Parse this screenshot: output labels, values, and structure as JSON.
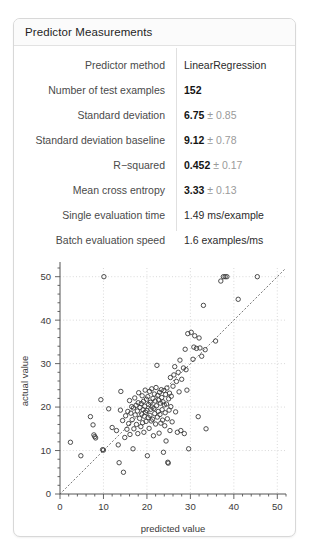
{
  "card": {
    "title": "Predictor Measurements"
  },
  "metrics": {
    "rows": [
      {
        "label": "Predictor method",
        "value_main": "LinearRegression",
        "value_pm": "",
        "bold": false
      },
      {
        "label": "Number of test examples",
        "value_main": "152",
        "value_pm": "",
        "bold": true
      },
      {
        "label": "Standard deviation",
        "value_main": "6.75",
        "value_pm": "± 0.85",
        "bold": true
      },
      {
        "label": "Standard deviation baseline",
        "value_main": "9.12",
        "value_pm": "± 0.78",
        "bold": true
      },
      {
        "label": "R−squared",
        "value_main": "0.452",
        "value_pm": "± 0.17",
        "bold": true
      },
      {
        "label": "Mean cross entropy",
        "value_main": "3.33",
        "value_pm": "± 0.13",
        "bold": true
      },
      {
        "label": "Single evaluation time",
        "value_main": "1.49 ms/example",
        "value_pm": "",
        "bold": false
      },
      {
        "label": "Batch evaluation speed",
        "value_main": "1.6 examples/ms",
        "value_pm": "",
        "bold": false
      }
    ]
  },
  "chart_data": {
    "type": "scatter",
    "title": "",
    "xlabel": "predicted value",
    "ylabel": "actual value",
    "xlim": [
      0,
      52
    ],
    "ylim": [
      0,
      52
    ],
    "xticks": [
      0,
      10,
      20,
      30,
      40,
      50
    ],
    "yticks": [
      0,
      10,
      20,
      30,
      40,
      50
    ],
    "minor_tick_step": 2,
    "grid": true,
    "grid_style": "dotted",
    "grid_color": "#cfcfcf",
    "marker": "open-circle",
    "marker_color": "#3a3a3a",
    "marker_radius": 2.2,
    "reference_line": {
      "label": "identity",
      "style": "dotted",
      "color": "#7a7a7a",
      "from": [
        0,
        0
      ],
      "to": [
        52,
        52
      ]
    },
    "n_points": 152,
    "points": [
      [
        2.4,
        11.9
      ],
      [
        4.8,
        8.8
      ],
      [
        7.0,
        17.8
      ],
      [
        7.6,
        15.9
      ],
      [
        7.8,
        13.6
      ],
      [
        8.0,
        13.2
      ],
      [
        8.2,
        12.9
      ],
      [
        9.4,
        21.7
      ],
      [
        9.8,
        10.2
      ],
      [
        10.0,
        10.1
      ],
      [
        10.1,
        50.0
      ],
      [
        11.2,
        19.6
      ],
      [
        12.0,
        15.3
      ],
      [
        13.0,
        14.6
      ],
      [
        13.4,
        11.3
      ],
      [
        13.6,
        7.2
      ],
      [
        13.9,
        19.3
      ],
      [
        14.0,
        23.6
      ],
      [
        14.4,
        16.9
      ],
      [
        14.6,
        5.0
      ],
      [
        14.9,
        13.0
      ],
      [
        15.1,
        18.0
      ],
      [
        15.4,
        14.9
      ],
      [
        15.6,
        19.0
      ],
      [
        15.8,
        16.2
      ],
      [
        16.0,
        21.5
      ],
      [
        16.1,
        13.7
      ],
      [
        16.3,
        18.6
      ],
      [
        16.5,
        20.1
      ],
      [
        16.6,
        17.1
      ],
      [
        16.8,
        10.4
      ],
      [
        16.9,
        19.8
      ],
      [
        17.0,
        15.0
      ],
      [
        17.2,
        22.1
      ],
      [
        17.3,
        18.2
      ],
      [
        17.5,
        20.4
      ],
      [
        17.6,
        16.0
      ],
      [
        17.8,
        19.1
      ],
      [
        17.9,
        13.9
      ],
      [
        18.0,
        21.0
      ],
      [
        18.1,
        23.3
      ],
      [
        18.3,
        17.4
      ],
      [
        18.4,
        19.9
      ],
      [
        18.6,
        15.5
      ],
      [
        18.7,
        20.8
      ],
      [
        18.8,
        18.4
      ],
      [
        18.9,
        22.6
      ],
      [
        19.0,
        16.4
      ],
      [
        19.1,
        19.4
      ],
      [
        19.2,
        21.3
      ],
      [
        19.3,
        14.2
      ],
      [
        19.4,
        17.9
      ],
      [
        19.5,
        20.2
      ],
      [
        19.6,
        23.9
      ],
      [
        19.7,
        18.8
      ],
      [
        19.8,
        16.7
      ],
      [
        19.9,
        21.8
      ],
      [
        20.0,
        19.2
      ],
      [
        20.1,
        8.8
      ],
      [
        20.2,
        22.4
      ],
      [
        20.3,
        17.6
      ],
      [
        20.4,
        20.6
      ],
      [
        20.5,
        15.1
      ],
      [
        20.6,
        23.6
      ],
      [
        20.7,
        18.1
      ],
      [
        20.8,
        21.1
      ],
      [
        20.9,
        19.5
      ],
      [
        21.0,
        16.8
      ],
      [
        21.1,
        24.2
      ],
      [
        21.2,
        20.0
      ],
      [
        21.3,
        17.2
      ],
      [
        21.4,
        22.0
      ],
      [
        21.5,
        13.4
      ],
      [
        21.6,
        19.7
      ],
      [
        21.7,
        23.0
      ],
      [
        21.8,
        18.5
      ],
      [
        21.9,
        21.4
      ],
      [
        22.0,
        16.1
      ],
      [
        22.1,
        24.5
      ],
      [
        22.2,
        20.3
      ],
      [
        22.3,
        29.6
      ],
      [
        22.4,
        17.7
      ],
      [
        22.5,
        22.7
      ],
      [
        22.6,
        19.0
      ],
      [
        22.7,
        21.6
      ],
      [
        22.8,
        14.0
      ],
      [
        22.9,
        23.4
      ],
      [
        23.0,
        18.3
      ],
      [
        23.1,
        20.9
      ],
      [
        23.2,
        16.3
      ],
      [
        23.3,
        24.0
      ],
      [
        23.4,
        22.2
      ],
      [
        23.5,
        19.4
      ],
      [
        23.6,
        17.0
      ],
      [
        23.7,
        21.2
      ],
      [
        23.8,
        9.6
      ],
      [
        23.9,
        23.8
      ],
      [
        24.0,
        20.5
      ],
      [
        24.1,
        15.7
      ],
      [
        24.2,
        18.7
      ],
      [
        24.3,
        22.9
      ],
      [
        24.4,
        12.2
      ],
      [
        24.5,
        20.7
      ],
      [
        24.6,
        24.4
      ],
      [
        24.7,
        17.3
      ],
      [
        24.8,
        7.3
      ],
      [
        24.9,
        7.1
      ],
      [
        25.0,
        21.9
      ],
      [
        25.1,
        19.3
      ],
      [
        25.2,
        23.2
      ],
      [
        25.3,
        14.6
      ],
      [
        25.4,
        26.8
      ],
      [
        25.5,
        20.1
      ],
      [
        25.6,
        22.5
      ],
      [
        25.8,
        16.6
      ],
      [
        26.0,
        24.8
      ],
      [
        26.2,
        27.4
      ],
      [
        26.4,
        29.3
      ],
      [
        26.6,
        18.9
      ],
      [
        26.8,
        25.9
      ],
      [
        27.0,
        14.2
      ],
      [
        27.2,
        28.0
      ],
      [
        27.4,
        23.5
      ],
      [
        27.6,
        30.8
      ],
      [
        27.8,
        14.6
      ],
      [
        28.0,
        26.4
      ],
      [
        28.4,
        29.0
      ],
      [
        28.6,
        13.9
      ],
      [
        28.8,
        33.3
      ],
      [
        29.0,
        28.6
      ],
      [
        29.2,
        23.9
      ],
      [
        29.4,
        36.9
      ],
      [
        29.6,
        10.4
      ],
      [
        30.2,
        37.2
      ],
      [
        30.6,
        31.0
      ],
      [
        30.8,
        33.8
      ],
      [
        31.0,
        36.4
      ],
      [
        31.4,
        33.5
      ],
      [
        31.8,
        17.8
      ],
      [
        32.0,
        35.9
      ],
      [
        32.2,
        33.6
      ],
      [
        32.6,
        31.7
      ],
      [
        33.0,
        43.4
      ],
      [
        33.4,
        33.2
      ],
      [
        33.6,
        15.0
      ],
      [
        35.8,
        35.2
      ],
      [
        37.0,
        49.0
      ],
      [
        37.6,
        50.0
      ],
      [
        38.0,
        50.0
      ],
      [
        38.4,
        50.0
      ],
      [
        41.0,
        44.8
      ],
      [
        45.4,
        50.0
      ]
    ]
  }
}
